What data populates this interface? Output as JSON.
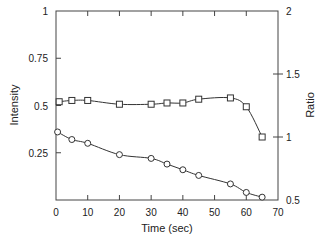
{
  "chart_data": {
    "type": "line",
    "title": "",
    "xlabel": "Time (sec)",
    "ylabel": "Intensity",
    "ylabel_right": "Ratio",
    "xlim": [
      0,
      70
    ],
    "ylim": [
      0,
      1
    ],
    "ylim_right": [
      0.5,
      2
    ],
    "x_ticks": [
      "0",
      "10",
      "20",
      "30",
      "40",
      "50",
      "60",
      "70"
    ],
    "y_ticks": [
      "0.25",
      "0.5",
      "0.75",
      "1"
    ],
    "y_ticks_right": [
      "0.5",
      "1",
      "1.5",
      "2"
    ],
    "grid": false,
    "series": [
      {
        "name": "Ratio",
        "axis": "right",
        "marker": "square",
        "x": [
          1,
          5,
          10,
          20,
          30,
          35,
          40,
          45,
          55,
          60,
          65
        ],
        "values": [
          1.28,
          1.29,
          1.29,
          1.26,
          1.26,
          1.27,
          1.27,
          1.3,
          1.31,
          1.24,
          1.0
        ]
      },
      {
        "name": "Intensity",
        "axis": "left",
        "marker": "circle",
        "x": [
          0.5,
          5,
          10,
          20,
          30,
          35,
          40,
          45,
          55,
          60,
          65
        ],
        "values": [
          0.36,
          0.32,
          0.3,
          0.24,
          0.22,
          0.19,
          0.16,
          0.13,
          0.085,
          0.04,
          0.015
        ]
      }
    ]
  }
}
